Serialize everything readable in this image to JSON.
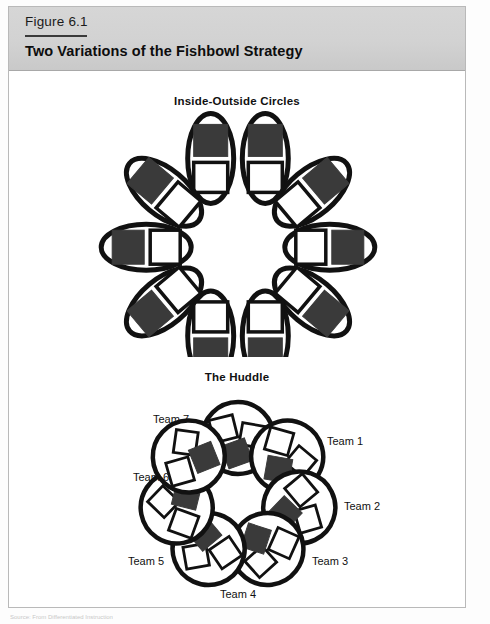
{
  "figure": {
    "number": "Figure 6.1",
    "title": "Two Variations of the Fishbowl Strategy"
  },
  "sections": [
    {
      "id": "inside-outside",
      "heading": "Inside-Outside Circles",
      "shape": "ellipse",
      "pair_count": 8,
      "description": "Eight elongated ellipses arranged in a ring; each ellipse holds one white square (inner circle member) and one dark square (outer circle member)."
    },
    {
      "id": "huddle",
      "heading": "The Huddle",
      "shape": "circle",
      "group_count": 7,
      "description": "Seven circles arranged in a ring; each circle holds two white squares and one dark square.",
      "labels": [
        "Team 1",
        "Team 2",
        "Team 3",
        "Team 4",
        "Team 5",
        "Team 6",
        "Team 7"
      ]
    }
  ],
  "colors": {
    "header_background": "#d2d2d2",
    "stroke": "#111111",
    "dark_square": "#3a3a3a",
    "light_square": "#ffffff",
    "page_background": "#ffffff",
    "frame_border": "#b9b9b9"
  },
  "source": {
    "text": "Source: From Differentiated Instruction",
    "visible": false
  }
}
